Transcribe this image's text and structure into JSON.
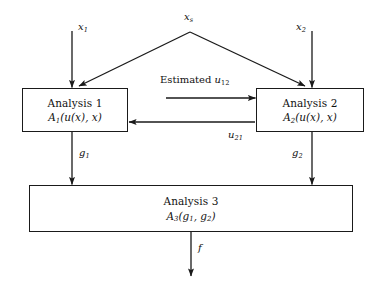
{
  "diagram": {
    "type": "flow-diagram",
    "background_color": "#ffffff",
    "line_color": "#1a1a1a",
    "nodes": [
      {
        "id": "analysis-1",
        "title": "Analysis 1",
        "formula_name": "A",
        "formula_sub": "1",
        "formula_args": "(u(x), x)",
        "x": 22,
        "y": 88,
        "w": 106,
        "h": 44
      },
      {
        "id": "analysis-2",
        "title": "Analysis 2",
        "formula_name": "A",
        "formula_sub": "2",
        "formula_args": "(u(x), x)",
        "x": 256,
        "y": 88,
        "w": 108,
        "h": 44
      },
      {
        "id": "analysis-3",
        "title": "Analysis 3",
        "formula_name": "A",
        "formula_sub": "3",
        "formula_args": "(g",
        "formula_args2": ", g",
        "formula_args3": ")",
        "x": 29,
        "y": 185,
        "w": 324,
        "h": 47
      }
    ],
    "labels": {
      "x1": {
        "base": "x",
        "sub": "1",
        "x": 78,
        "y": 22
      },
      "xs": {
        "base": "x",
        "sub": "s",
        "x": 184,
        "y": 12
      },
      "x2": {
        "base": "x",
        "sub": "2",
        "x": 296,
        "y": 22
      },
      "estimated_u12": {
        "prefix": "Estimated ",
        "base": "u",
        "sub": "12",
        "x": 160,
        "y": 76
      },
      "u21": {
        "base": "u",
        "sub": "21",
        "x": 228,
        "y": 131
      },
      "g1": {
        "base": "g",
        "sub": "1",
        "x": 79,
        "y": 148
      },
      "g2": {
        "base": "g",
        "sub": "2",
        "x": 292,
        "y": 148
      },
      "f": {
        "base": "f",
        "sub": "",
        "x": 198,
        "y": 243
      }
    },
    "edges": [
      {
        "id": "x1-to-analysis-1",
        "from": "x1",
        "to": "analysis-1",
        "kind": "arrow-down"
      },
      {
        "id": "xs-to-analysis-1",
        "from": "xs",
        "to": "analysis-1",
        "kind": "arrow-diagonal-left"
      },
      {
        "id": "xs-to-analysis-2",
        "from": "xs",
        "to": "analysis-2",
        "kind": "arrow-diagonal-right"
      },
      {
        "id": "x2-to-analysis-2",
        "from": "x2",
        "to": "analysis-2",
        "kind": "arrow-down"
      },
      {
        "id": "analysis-1-to-analysis-2",
        "from": "analysis-1",
        "to": "analysis-2",
        "label": "Estimated u12",
        "kind": "arrow-right"
      },
      {
        "id": "analysis-2-to-analysis-1",
        "from": "analysis-2",
        "to": "analysis-1",
        "label": "u21",
        "kind": "arrow-left"
      },
      {
        "id": "analysis-1-to-analysis-3",
        "from": "analysis-1",
        "to": "analysis-3",
        "label": "g1",
        "kind": "arrow-down"
      },
      {
        "id": "analysis-2-to-analysis-3",
        "from": "analysis-2",
        "to": "analysis-3",
        "label": "g2",
        "kind": "arrow-down"
      },
      {
        "id": "analysis-3-to-output",
        "from": "analysis-3",
        "to": "output",
        "label": "f",
        "kind": "arrow-down"
      }
    ]
  }
}
